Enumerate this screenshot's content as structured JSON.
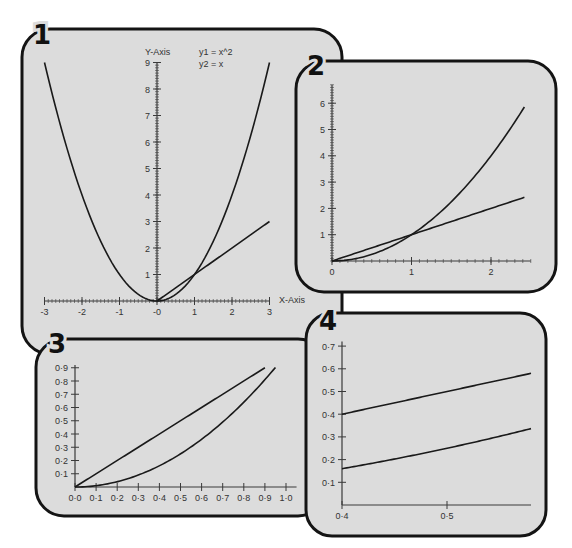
{
  "colors": {
    "panel_fill": "#dcdcdc",
    "panel_stroke": "#141414",
    "curve": "#1a1a1a",
    "axis": "#3a3a3a",
    "label": "#333333",
    "background": "#ffffff"
  },
  "chart_data": [
    {
      "type": "line",
      "panel_label": "1",
      "title": "",
      "legend": [
        "y1 = x^2",
        "y2 = x"
      ],
      "xlabel": "X-Axis",
      "ylabel": "Y-Axis",
      "xlim": [
        -3,
        3
      ],
      "ylim": [
        0,
        9
      ],
      "x_ticks": [
        "-3",
        "-2",
        "-1",
        "-0",
        "1",
        "2",
        "3"
      ],
      "y_ticks": [
        "1",
        "2",
        "3",
        "4",
        "5",
        "6",
        "7",
        "8",
        "9"
      ],
      "grid": false,
      "series": [
        {
          "name": "y1 = x^2",
          "x": [
            -3,
            -2,
            -1,
            0,
            1,
            2,
            3
          ],
          "y": [
            9,
            4,
            1,
            0,
            1,
            4,
            9
          ]
        },
        {
          "name": "y2 = x",
          "x": [
            0,
            3
          ],
          "y": [
            0,
            3
          ]
        }
      ]
    },
    {
      "type": "line",
      "panel_label": "2",
      "xlim": [
        0,
        2.4
      ],
      "ylim": [
        0,
        6.5
      ],
      "x_ticks": [
        "0",
        "1",
        "2"
      ],
      "y_ticks": [
        "1",
        "2",
        "3",
        "4",
        "5",
        "6"
      ],
      "grid": false,
      "series": [
        {
          "name": "y1 = x^2",
          "x": [
            0,
            0.5,
            1,
            1.5,
            2,
            2.4
          ],
          "y": [
            0,
            0.25,
            1,
            2.25,
            4,
            5.76
          ]
        },
        {
          "name": "y2 = x",
          "x": [
            0,
            2.4
          ],
          "y": [
            0,
            2.4
          ]
        }
      ]
    },
    {
      "type": "line",
      "panel_label": "3",
      "xlim": [
        0,
        1.0
      ],
      "ylim": [
        0,
        0.9
      ],
      "x_ticks": [
        "0·0",
        "0·1",
        "0·2",
        "0·3",
        "0·4",
        "0·5",
        "0·6",
        "0·7",
        "0·8",
        "0·9",
        "1·0"
      ],
      "y_ticks": [
        "0·1",
        "0·2",
        "0·3",
        "0·4",
        "0·5",
        "0·6",
        "0·7",
        "0·8",
        "0·9"
      ],
      "grid": false,
      "series": [
        {
          "name": "y1 = x^2",
          "x": [
            0,
            0.3,
            0.5,
            0.7,
            0.9,
            0.95
          ],
          "y": [
            0,
            0.09,
            0.25,
            0.49,
            0.81,
            0.9
          ]
        },
        {
          "name": "y2 = x",
          "x": [
            0,
            0.9
          ],
          "y": [
            0,
            0.9
          ]
        }
      ]
    },
    {
      "type": "line",
      "panel_label": "4",
      "xlim": [
        0.4,
        0.58
      ],
      "ylim": [
        0,
        0.7
      ],
      "x_ticks": [
        "0·4",
        "0·5"
      ],
      "y_ticks": [
        "0·1",
        "0·2",
        "0·3",
        "0·4",
        "0·5",
        "0·6",
        "0·7"
      ],
      "grid": false,
      "series": [
        {
          "name": "y1 = x^2",
          "x": [
            0.4,
            0.45,
            0.5,
            0.55,
            0.58
          ],
          "y": [
            0.16,
            0.2025,
            0.25,
            0.3025,
            0.3364
          ]
        },
        {
          "name": "y2 = x",
          "x": [
            0.4,
            0.58
          ],
          "y": [
            0.4,
            0.58
          ]
        }
      ]
    }
  ],
  "panels": [
    {
      "label": "1",
      "box": {
        "x": 22,
        "y": 29,
        "w": 320,
        "h": 325,
        "r": 28
      },
      "label_pos": {
        "x": 42,
        "y": 44
      },
      "axes": {
        "origin_px": [
          157,
          301
        ],
        "x_px_per_unit": 37.5,
        "y_px_per_unit": 26.5,
        "x_range": [
          -3,
          3
        ],
        "y_range": [
          0,
          9
        ],
        "x_minor": 0.1,
        "y_minor": 0.1,
        "x_major_ticks": [
          {
            "v": -3,
            "t": "-3"
          },
          {
            "v": -2,
            "t": "-2"
          },
          {
            "v": -1,
            "t": "-1"
          },
          {
            "v": 0,
            "t": "-0"
          },
          {
            "v": 1,
            "t": "1"
          },
          {
            "v": 2,
            "t": "2"
          },
          {
            "v": 3,
            "t": "3"
          }
        ],
        "y_major_ticks": [
          {
            "v": 1,
            "t": "1"
          },
          {
            "v": 2,
            "t": "2"
          },
          {
            "v": 3,
            "t": "3"
          },
          {
            "v": 4,
            "t": "4"
          },
          {
            "v": 5,
            "t": "5"
          },
          {
            "v": 6,
            "t": "6"
          },
          {
            "v": 7,
            "t": "7"
          },
          {
            "v": 8,
            "t": "8"
          },
          {
            "v": 9,
            "t": "9"
          }
        ],
        "x_label": {
          "text": "X-Axis",
          "x": 279,
          "y": 303
        },
        "y_label": {
          "text": "Y-Axis",
          "x": 145,
          "y": 55
        },
        "legend": [
          {
            "text": "y1 = x^2",
            "x": 199,
            "y": 55
          },
          {
            "text": "y2 = x",
            "x": 199,
            "y": 67
          }
        ]
      },
      "curves": [
        {
          "kind": "square",
          "from": -3,
          "to": 3
        },
        {
          "kind": "linear",
          "from": 0,
          "to": 3
        }
      ]
    },
    {
      "label": "2",
      "box": {
        "x": 296,
        "y": 61,
        "w": 260,
        "h": 231,
        "r": 28
      },
      "label_pos": {
        "x": 316,
        "y": 75
      },
      "axes": {
        "origin_px": [
          332,
          261
        ],
        "x_px_per_unit": 79.5,
        "y_px_per_unit": 26.3,
        "x_range": [
          0,
          2.5
        ],
        "y_range": [
          0,
          6.7
        ],
        "x_minor": 0.1,
        "y_minor": 0.1,
        "x_major_ticks": [
          {
            "v": 0,
            "t": "0"
          },
          {
            "v": 1,
            "t": "1"
          },
          {
            "v": 2,
            "t": "2"
          }
        ],
        "y_major_ticks": [
          {
            "v": 1,
            "t": "1"
          },
          {
            "v": 2,
            "t": "2"
          },
          {
            "v": 3,
            "t": "3"
          },
          {
            "v": 4,
            "t": "4"
          },
          {
            "v": 5,
            "t": "5"
          },
          {
            "v": 6,
            "t": "6"
          }
        ]
      },
      "curves": [
        {
          "kind": "square",
          "from": 0,
          "to": 2.42
        },
        {
          "kind": "linear",
          "from": 0,
          "to": 2.42
        }
      ]
    },
    {
      "label": "3",
      "box": {
        "x": 36,
        "y": 339,
        "w": 290,
        "h": 177,
        "r": 28
      },
      "label_pos": {
        "x": 57,
        "y": 353
      },
      "axes": {
        "origin_px": [
          75,
          487
        ],
        "x_px_per_unit": 211,
        "y_px_per_unit": 132.5,
        "x_range": [
          0,
          1.05
        ],
        "y_range": [
          0,
          0.92
        ],
        "x_major_ticks": [
          {
            "v": 0,
            "t": "0·0"
          },
          {
            "v": 0.1,
            "t": "0·1"
          },
          {
            "v": 0.2,
            "t": "0·2"
          },
          {
            "v": 0.3,
            "t": "0·3"
          },
          {
            "v": 0.4,
            "t": "0·4"
          },
          {
            "v": 0.5,
            "t": "0·5"
          },
          {
            "v": 0.6,
            "t": "0·6"
          },
          {
            "v": 0.7,
            "t": "0·7"
          },
          {
            "v": 0.8,
            "t": "0·8"
          },
          {
            "v": 0.9,
            "t": "0·9"
          },
          {
            "v": 1.0,
            "t": "1·0"
          }
        ],
        "y_major_ticks": [
          {
            "v": 0.1,
            "t": "0·1"
          },
          {
            "v": 0.2,
            "t": "0·2"
          },
          {
            "v": 0.3,
            "t": "0·3"
          },
          {
            "v": 0.4,
            "t": "0·4"
          },
          {
            "v": 0.5,
            "t": "0·5"
          },
          {
            "v": 0.6,
            "t": "0·6"
          },
          {
            "v": 0.7,
            "t": "0·7"
          },
          {
            "v": 0.8,
            "t": "0·8"
          },
          {
            "v": 0.9,
            "t": "0·9"
          }
        ]
      },
      "curves": [
        {
          "kind": "square",
          "from": 0,
          "to": 0.95
        },
        {
          "kind": "linear",
          "from": 0,
          "to": 0.9
        }
      ]
    },
    {
      "label": "4",
      "box": {
        "x": 306,
        "y": 313,
        "w": 240,
        "h": 223,
        "r": 26
      },
      "label_pos": {
        "x": 328,
        "y": 330
      },
      "axes": {
        "origin_px": [
          342,
          505
        ],
        "x_origin_value": 0.4,
        "x_px_per_unit": 1050,
        "y_px_per_unit": 227,
        "x_range": [
          0.4,
          0.58
        ],
        "y_range": [
          0,
          0.72
        ],
        "x_major_ticks": [
          {
            "v": 0.4,
            "t": "0·4"
          },
          {
            "v": 0.5,
            "t": "0·5"
          }
        ],
        "y_major_ticks": [
          {
            "v": 0.1,
            "t": "0·1"
          },
          {
            "v": 0.2,
            "t": "0·2"
          },
          {
            "v": 0.3,
            "t": "0·3"
          },
          {
            "v": 0.4,
            "t": "0·4"
          },
          {
            "v": 0.5,
            "t": "0·5"
          },
          {
            "v": 0.6,
            "t": "0·6"
          },
          {
            "v": 0.7,
            "t": "0·7"
          }
        ]
      },
      "curves": [
        {
          "kind": "square",
          "from": 0.4,
          "to": 0.58
        },
        {
          "kind": "linear",
          "from": 0.4,
          "to": 0.58
        }
      ]
    }
  ]
}
